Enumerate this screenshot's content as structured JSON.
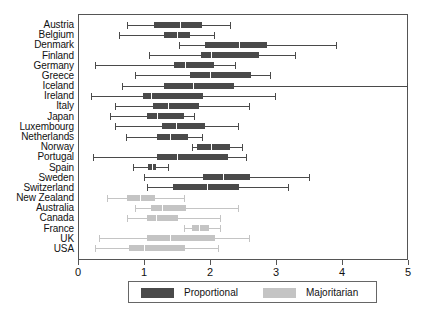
{
  "chart_data": {
    "type": "box",
    "title": "",
    "xlabel": "",
    "ylabel": "",
    "xlim": [
      0,
      5
    ],
    "xticks": [
      0,
      1,
      2,
      3,
      4,
      5
    ],
    "xticklabels": [
      "0",
      "1",
      "2",
      "3",
      "4",
      "5"
    ],
    "grid": false,
    "orientation": "horizontal",
    "legend": {
      "position": "bottom-center",
      "entries": [
        {
          "label": "Proportional",
          "color": "#4a4a4a"
        },
        {
          "label": "Majoritarian",
          "color": "#c4c4c4"
        }
      ]
    },
    "categories": [
      "Austria",
      "Belgium",
      "Denmark",
      "Finland",
      "Germany",
      "Greece",
      "Iceland",
      "Ireland",
      "Italy",
      "Japan",
      "Luxembourg",
      "Netherlands",
      "Norway",
      "Portugal",
      "Spain",
      "Sweden",
      "Switzerland",
      "New Zealand",
      "Australia",
      "Canada",
      "France",
      "UK",
      "USA"
    ],
    "boxes": [
      {
        "category": "Austria",
        "group": "Proportional",
        "min": 0.74,
        "q1": 1.15,
        "median": 1.54,
        "q3": 1.88,
        "max": 2.32
      },
      {
        "category": "Belgium",
        "group": "Proportional",
        "min": 0.62,
        "q1": 1.3,
        "median": 1.5,
        "q3": 1.7,
        "max": 2.08
      },
      {
        "category": "Denmark",
        "group": "Proportional",
        "min": 1.53,
        "q1": 1.92,
        "median": 2.44,
        "q3": 2.87,
        "max": 3.92
      },
      {
        "category": "Finland",
        "group": "Proportional",
        "min": 1.08,
        "q1": 1.86,
        "median": 2.02,
        "q3": 2.74,
        "max": 3.3
      },
      {
        "category": "Germany",
        "group": "Proportional",
        "min": 0.25,
        "q1": 1.46,
        "median": 1.62,
        "q3": 2.06,
        "max": 2.4
      },
      {
        "category": "Greece",
        "group": "Proportional",
        "min": 0.86,
        "q1": 1.7,
        "median": 2.0,
        "q3": 2.62,
        "max": 2.92
      },
      {
        "category": "Iceland",
        "group": "Proportional",
        "min": 0.66,
        "q1": 1.3,
        "median": 1.74,
        "q3": 2.36,
        "max": 5.05
      },
      {
        "category": "Ireland",
        "group": "Proportional",
        "min": 0.2,
        "q1": 0.98,
        "median": 1.1,
        "q3": 1.9,
        "max": 3.0
      },
      {
        "category": "Italy",
        "group": "Proportional",
        "min": 0.56,
        "q1": 1.14,
        "median": 1.36,
        "q3": 1.84,
        "max": 2.6
      },
      {
        "category": "Japan",
        "group": "Proportional",
        "min": 0.48,
        "q1": 1.04,
        "median": 1.2,
        "q3": 1.6,
        "max": 1.78
      },
      {
        "category": "Luxembourg",
        "group": "Proportional",
        "min": 0.56,
        "q1": 1.27,
        "median": 1.48,
        "q3": 1.92,
        "max": 2.44
      },
      {
        "category": "Netherlands",
        "group": "Proportional",
        "min": 0.72,
        "q1": 1.2,
        "median": 1.4,
        "q3": 1.66,
        "max": 1.9
      },
      {
        "category": "Norway",
        "group": "Proportional",
        "min": 1.72,
        "q1": 1.8,
        "median": 2.02,
        "q3": 2.3,
        "max": 2.5
      },
      {
        "category": "Portugal",
        "group": "Proportional",
        "min": 0.22,
        "q1": 1.2,
        "median": 1.5,
        "q3": 2.28,
        "max": 2.56
      },
      {
        "category": "Spain",
        "group": "Proportional",
        "min": 0.84,
        "q1": 1.06,
        "median": 1.12,
        "q3": 1.18,
        "max": 1.38
      },
      {
        "category": "Sweden",
        "group": "Proportional",
        "min": 1.0,
        "q1": 1.9,
        "median": 2.2,
        "q3": 2.6,
        "max": 3.52
      },
      {
        "category": "Switzerland",
        "group": "Proportional",
        "min": 1.04,
        "q1": 1.44,
        "median": 1.96,
        "q3": 2.44,
        "max": 3.2
      },
      {
        "category": "New Zealand",
        "group": "Majoritarian",
        "min": 0.44,
        "q1": 0.74,
        "median": 0.94,
        "q3": 1.16,
        "max": 1.62
      },
      {
        "category": "Australia",
        "group": "Majoritarian",
        "min": 0.86,
        "q1": 1.1,
        "median": 1.28,
        "q3": 1.64,
        "max": 2.44
      },
      {
        "category": "Canada",
        "group": "Majoritarian",
        "min": 0.74,
        "q1": 1.04,
        "median": 1.18,
        "q3": 1.52,
        "max": 2.16
      },
      {
        "category": "France",
        "group": "Majoritarian",
        "min": 1.6,
        "q1": 1.72,
        "median": 1.84,
        "q3": 1.98,
        "max": 2.16
      },
      {
        "category": "UK",
        "group": "Majoritarian",
        "min": 0.32,
        "q1": 1.04,
        "median": 1.4,
        "q3": 2.08,
        "max": 2.6
      },
      {
        "category": "USA",
        "group": "Majoritarian",
        "min": 0.26,
        "q1": 0.78,
        "median": 1.0,
        "q3": 1.62,
        "max": 2.14
      }
    ]
  },
  "axis": {
    "left_px": 78,
    "top_px": 14,
    "width_px": 330,
    "height_px": 246
  }
}
